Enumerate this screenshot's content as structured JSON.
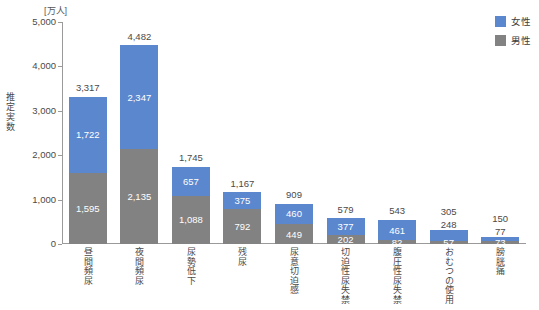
{
  "chart": {
    "unit_label": "[万人]",
    "y_axis_title": "推定実数"
  },
  "legend": {
    "position": "top-right",
    "items": [
      {
        "label": "女性",
        "color": "#5b87cf",
        "name": "legend-female"
      },
      {
        "label": "男性",
        "color": "#828282",
        "name": "legend-male"
      }
    ]
  },
  "chart_data": {
    "type": "bar",
    "subtype": "stacked",
    "title": "",
    "subtitle": "",
    "xlabel": "",
    "ylabel": "推定実数",
    "unit": "[万人]",
    "ylim": [
      0,
      5000
    ],
    "grid": false,
    "legend_position": "top-right",
    "ytick_labels": [
      "5,000",
      "4,000",
      "3,000",
      "2,000",
      "1,000",
      "0"
    ],
    "yticks": [
      5000,
      4000,
      3000,
      2000,
      1000,
      0
    ],
    "categories": [
      "昼間頻尿",
      "夜間頻尿",
      "尿勢低下",
      "残尿",
      "尿意切迫感",
      "切迫性尿失禁",
      "腹圧性尿失禁",
      "おむつの使用",
      "膀胱痛"
    ],
    "series": [
      {
        "name": "男性",
        "color": "#828282",
        "values": [
          1595,
          2135,
          1088,
          792,
          449,
          202,
          82,
          57,
          73
        ],
        "labels": [
          "1,595",
          "2,135",
          "1,088",
          "792",
          "449",
          "202",
          "82",
          "57",
          "73"
        ]
      },
      {
        "name": "女性",
        "color": "#5b87cf",
        "values": [
          1722,
          2347,
          657,
          375,
          460,
          377,
          461,
          248,
          77
        ],
        "labels": [
          "1,722",
          "2,347",
          "657",
          "375",
          "460",
          "377",
          "461",
          "248",
          "77"
        ]
      }
    ],
    "totals": [
      3317,
      4482,
      1745,
      1167,
      909,
      579,
      543,
      305,
      150
    ],
    "total_labels": [
      "3,317",
      "4,482",
      "1,745",
      "1,167",
      "909",
      "579",
      "543",
      "305",
      "150"
    ]
  }
}
